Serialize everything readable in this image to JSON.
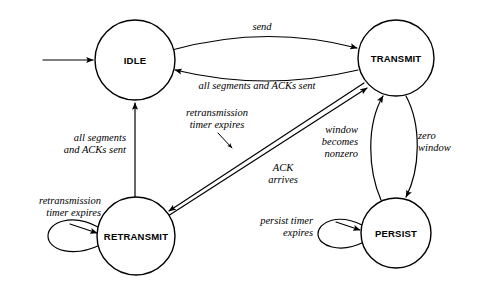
{
  "diagram": {
    "type": "state-transition-diagram",
    "colors": {
      "background": "#ffffff",
      "stroke": "#000000",
      "text": "#000000"
    },
    "states": [
      {
        "id": "idle",
        "label": "IDLE",
        "cx": 135,
        "cy": 60,
        "r": 40
      },
      {
        "id": "transmit",
        "label": "TRANSMIT",
        "cx": 396,
        "cy": 58,
        "r": 38
      },
      {
        "id": "retransmit",
        "label": "RETRANSMIT",
        "cx": 136,
        "cy": 236,
        "r": 39
      },
      {
        "id": "persist",
        "label": "PERSIST",
        "cx": 396,
        "cy": 233,
        "r": 35
      }
    ],
    "transitions": [
      {
        "id": "start-idle",
        "from": "start",
        "to": "idle",
        "label": ""
      },
      {
        "id": "idle-transmit",
        "from": "idle",
        "to": "transmit",
        "label": "send"
      },
      {
        "id": "transmit-idle",
        "from": "transmit",
        "to": "idle",
        "label": "all segments and ACKs sent"
      },
      {
        "id": "transmit-retransmit",
        "from": "transmit",
        "to": "retransmit",
        "label_line1": "retransmission",
        "label_line2": "timer expires"
      },
      {
        "id": "retransmit-transmit",
        "from": "retransmit",
        "to": "transmit",
        "label_line1": "ACK",
        "label_line2": "arrives"
      },
      {
        "id": "retransmit-idle",
        "from": "retransmit",
        "to": "idle",
        "label_line1": "all segments",
        "label_line2": "and ACKs sent"
      },
      {
        "id": "retransmit-self",
        "from": "retransmit",
        "to": "retransmit",
        "label_line1": "retransmission",
        "label_line2": "timer expires"
      },
      {
        "id": "persist-transmit",
        "from": "persist",
        "to": "transmit",
        "label_line1": "window",
        "label_line2": "becomes",
        "label_line3": "nonzero"
      },
      {
        "id": "transmit-persist",
        "from": "transmit",
        "to": "persist",
        "label_line1": "zero",
        "label_line2": "window"
      },
      {
        "id": "persist-self",
        "from": "persist",
        "to": "persist",
        "label_line1": "persist timer",
        "label_line2": "expires"
      }
    ]
  }
}
